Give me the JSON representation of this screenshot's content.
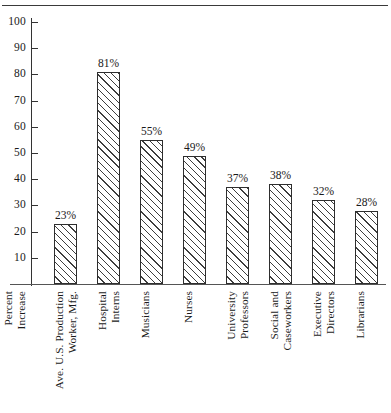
{
  "chart_data": {
    "type": "bar",
    "title": "",
    "subtitle": "",
    "xlabel": "",
    "ylabel": "Percent Increase",
    "ylabel_lines": [
      "Percent",
      "Increase"
    ],
    "ylim": [
      0,
      105
    ],
    "yticks": [
      10,
      20,
      30,
      40,
      50,
      60,
      70,
      80,
      90,
      100
    ],
    "ytick_labels": [
      "10",
      "20",
      "30",
      "40",
      "50",
      "60",
      "70",
      "80",
      "90",
      "100"
    ],
    "grid": false,
    "legend": false,
    "value_label_suffix": "%",
    "categories": [
      "Ave. U.S. Production Worker, Mfg.",
      "Hospital Interns",
      "Musicians",
      "Nurses",
      "University Professors",
      "Social and Caseworkers",
      "Executive Directors",
      "Librarians"
    ],
    "category_lines": [
      [
        "Ave. U.S. Production",
        "Worker, Mfg."
      ],
      [
        "Hospital",
        "Interns"
      ],
      [
        "Musicians"
      ],
      [
        "Nurses"
      ],
      [
        "University",
        "Professors"
      ],
      [
        "Social and",
        "Caseworkers"
      ],
      [
        "Executive",
        "Directors"
      ],
      [
        "Librarians"
      ]
    ],
    "values": [
      23,
      81,
      55,
      49,
      37,
      38,
      32,
      28
    ],
    "value_labels": [
      "23%",
      "81%",
      "55%",
      "49%",
      "37%",
      "38%",
      "32%",
      "28%"
    ],
    "colors": {
      "bar_fill": "#ffffff",
      "bar_edge": "#2e2e2e",
      "hatch": "#3d3d3d",
      "axis": "#333333",
      "text": "#1a1a1a",
      "background": "#ffffff"
    },
    "hatch_pattern": "diagonal-forward-slash"
  }
}
